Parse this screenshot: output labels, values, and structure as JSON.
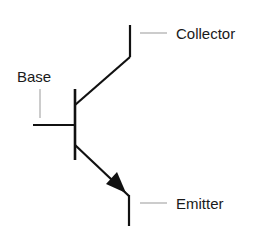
{
  "diagram": {
    "type": "npn-transistor-symbol",
    "labels": {
      "collector": "Collector",
      "base": "Base",
      "emitter": "Emitter"
    },
    "colors": {
      "line": "#111111",
      "leader": "#999999",
      "text": "#1a1a1a",
      "background": "#ffffff"
    }
  }
}
